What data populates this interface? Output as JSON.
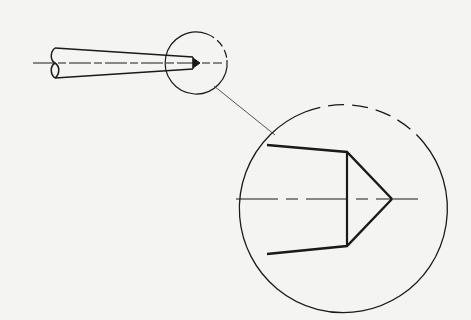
{
  "diagram": {
    "type": "technical-drawing",
    "colors": {
      "background": "#f4f4f2",
      "line": "#1a1a1a",
      "leader": "#555555"
    },
    "overview": {
      "label": "",
      "detail_circle_style": "partially-dashed"
    },
    "detail_view": {
      "label": "",
      "circle_style": "partially-dashed"
    }
  }
}
